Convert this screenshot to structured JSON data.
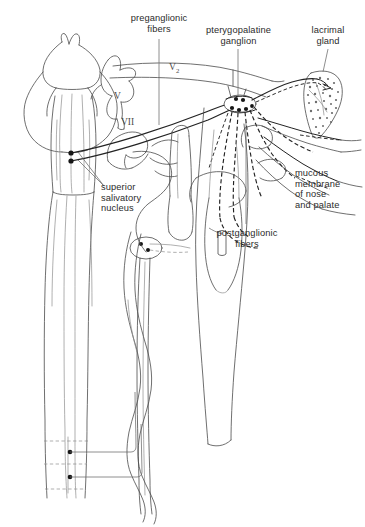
{
  "figure": {
    "domain": "anatomy-line-diagram",
    "background_color": "#ffffff",
    "line_color": "#3a3a3a",
    "faint_line_color": "#8e8e8e",
    "text_color": "#2b2b2b"
  },
  "labels": {
    "preganglionic_fibers": {
      "line1": "preganglionic",
      "line2": "fibers"
    },
    "pterygopalatine_ganglion": {
      "line1": "pterygopalatine",
      "line2": "ganglion"
    },
    "lacrimal_gland": {
      "line1": "lacrimal",
      "line2": "gland"
    },
    "superior_salivatory_nucleus": {
      "line1": "superior",
      "line2": "salivatory",
      "line3": "nucleus"
    },
    "postganglionic_fibers": {
      "line1": "postganglionic",
      "line2": "fibers"
    },
    "mucous_membrane": {
      "line1": "mucous",
      "line2": "membrane",
      "line3": "of nose",
      "line4": "and palate"
    }
  },
  "nerve_tags": {
    "trigeminal": "V",
    "maxillary_division": "V2",
    "maxillary_division_root": "V",
    "maxillary_division_sub": "2",
    "facial": "VII"
  },
  "structures": [
    {
      "name": "brainstem",
      "description": "pons and medulla outline, upper left"
    },
    {
      "name": "spinal-cord",
      "description": "long vertical cord descending from medulla"
    },
    {
      "name": "trigeminal-nerve-V",
      "description": "branching nerve trunk labelled V"
    },
    {
      "name": "facial-nerve-VII",
      "description": "nerve trunk labelled VII leaving brainstem"
    },
    {
      "name": "maxillary-nerve-V2",
      "description": "long arcing nerve labelled V2 crossing the top"
    },
    {
      "name": "pterygopalatine-ganglion",
      "description": "small oval ganglion with neuron cell bodies"
    },
    {
      "name": "lacrimal-gland",
      "description": "stippled teardrop-shaped gland at upper right"
    },
    {
      "name": "superior-salivatory-nucleus",
      "description": "two neuron cell bodies in the pons"
    },
    {
      "name": "preganglionic-fiber-bundle",
      "description": "solid paired fibers from nucleus to ganglion"
    },
    {
      "name": "postganglionic-fiber-bundle",
      "description": "dashed fibers radiating from ganglion"
    },
    {
      "name": "sympathetic-chain",
      "description": "wavy vertical chain beside the cord"
    },
    {
      "name": "spinal-segment-neurons",
      "description": "two cell bodies with horizontal fibers at cord base"
    }
  ]
}
